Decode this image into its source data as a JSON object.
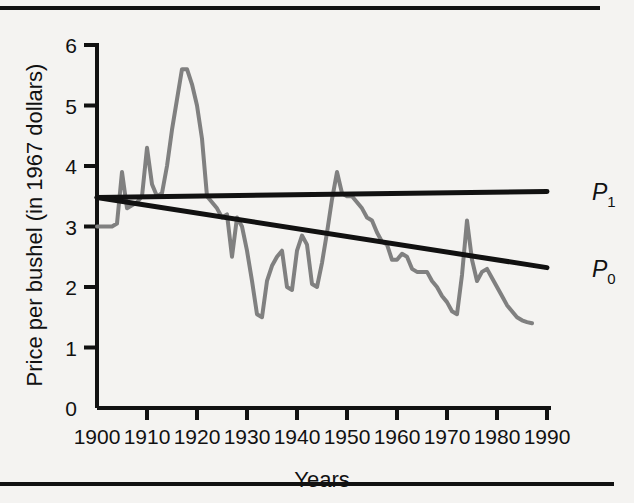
{
  "figure": {
    "background_color": "#f4f3f1",
    "rule_color": "#111111"
  },
  "chart_data": {
    "type": "line",
    "title": "",
    "subtitle": "",
    "xlabel": "Years",
    "ylabel": "Price per bushel (in 1967 dollars)",
    "xlim": [
      1900,
      1990
    ],
    "ylim": [
      0,
      6
    ],
    "xticks": [
      1900,
      1910,
      1920,
      1930,
      1940,
      1950,
      1960,
      1970,
      1980,
      1990
    ],
    "xtick_labels": [
      "1900",
      "1910",
      "1920",
      "1930",
      "1940",
      "1950",
      "1960",
      "1970",
      "1980",
      "1990"
    ],
    "yticks": [
      0,
      1,
      2,
      3,
      4,
      5,
      6
    ],
    "ytick_labels": [
      "0",
      "1",
      "2",
      "3",
      "4",
      "5",
      "6"
    ],
    "grid": false,
    "legend_position": "right-inline",
    "series": [
      {
        "name": "actual-price",
        "label": "",
        "color": "#808080",
        "width": 4,
        "style": "solid",
        "x": [
          1900,
          1901,
          1902,
          1903,
          1904,
          1905,
          1906,
          1907,
          1908,
          1909,
          1910,
          1911,
          1912,
          1913,
          1914,
          1915,
          1916,
          1917,
          1918,
          1919,
          1920,
          1921,
          1922,
          1923,
          1924,
          1925,
          1926,
          1927,
          1928,
          1929,
          1930,
          1931,
          1932,
          1933,
          1934,
          1935,
          1936,
          1937,
          1938,
          1939,
          1940,
          1941,
          1942,
          1943,
          1944,
          1945,
          1946,
          1947,
          1948,
          1949,
          1950,
          1951,
          1952,
          1953,
          1954,
          1955,
          1956,
          1957,
          1958,
          1959,
          1960,
          1961,
          1962,
          1963,
          1964,
          1965,
          1966,
          1967,
          1968,
          1969,
          1970,
          1971,
          1972,
          1973,
          1974,
          1975,
          1976,
          1977,
          1978,
          1979,
          1980,
          1981,
          1982,
          1983,
          1984,
          1985,
          1986,
          1987
        ],
        "y": [
          3.0,
          3.0,
          3.0,
          3.0,
          3.05,
          3.9,
          3.3,
          3.35,
          3.4,
          3.5,
          4.3,
          3.7,
          3.5,
          3.55,
          4.0,
          4.6,
          5.1,
          5.6,
          5.6,
          5.35,
          5.0,
          4.45,
          3.5,
          3.4,
          3.3,
          3.15,
          3.2,
          2.5,
          3.15,
          3.0,
          2.6,
          2.1,
          1.55,
          1.5,
          2.1,
          2.35,
          2.5,
          2.6,
          2.0,
          1.95,
          2.6,
          2.85,
          2.7,
          2.05,
          2.0,
          2.4,
          2.9,
          3.45,
          3.9,
          3.55,
          3.5,
          3.5,
          3.4,
          3.3,
          3.15,
          3.1,
          2.9,
          2.75,
          2.7,
          2.45,
          2.45,
          2.55,
          2.5,
          2.3,
          2.25,
          2.25,
          2.25,
          2.1,
          2.0,
          1.85,
          1.75,
          1.6,
          1.55,
          2.2,
          3.1,
          2.45,
          2.1,
          2.25,
          2.3,
          2.15,
          2.0,
          1.85,
          1.7,
          1.6,
          1.5,
          1.45,
          1.42,
          1.4
        ]
      },
      {
        "name": "trend-p1",
        "label": "P",
        "label_sub": "1",
        "color": "#111111",
        "width": 5,
        "style": "solid",
        "x": [
          1900,
          1990
        ],
        "y": [
          3.48,
          3.58
        ]
      },
      {
        "name": "trend-p0",
        "label": "P",
        "label_sub": "0",
        "color": "#111111",
        "width": 5,
        "style": "solid",
        "x": [
          1900,
          1990
        ],
        "y": [
          3.48,
          2.32
        ]
      }
    ],
    "annotations": [
      {
        "name": "p1-label",
        "text": "P",
        "sub": "1",
        "x": 1995,
        "y": 3.58
      },
      {
        "name": "p0-label",
        "text": "P",
        "sub": "0",
        "x": 1995,
        "y": 2.32
      }
    ]
  }
}
